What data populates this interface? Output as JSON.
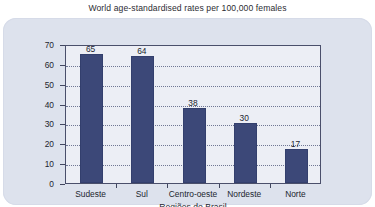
{
  "chart_data": {
    "type": "bar",
    "title": "World age-standardised rates per 100,000 females",
    "xlabel": "Regiões do Brasil",
    "ylabel": "",
    "categories": [
      "Sudeste",
      "Sul",
      "Centro-oeste",
      "Nordeste",
      "Norte"
    ],
    "values": [
      65,
      64,
      38,
      30,
      17
    ],
    "value_labels": [
      "65",
      "64",
      "38",
      "30",
      "17"
    ],
    "ylim": [
      0,
      70
    ],
    "yticks": [
      0,
      10,
      20,
      30,
      40,
      50,
      60,
      70
    ],
    "ytick_labels": [
      "0",
      "10",
      "20",
      "30",
      "40",
      "50",
      "60",
      "70"
    ],
    "grid": true,
    "legend": false,
    "bar_color": "#3c4878",
    "plot_background": "#eceef5",
    "panel_background": "#dde2ed",
    "axis_color": "#4a4f6b",
    "gridline_color": "#5b6384",
    "text_color": "#22262f"
  }
}
